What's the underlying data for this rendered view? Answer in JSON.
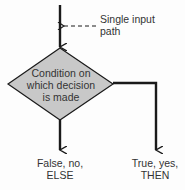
{
  "diagram": {
    "annotation": {
      "line1": "Single input",
      "line2": "path"
    },
    "decision": {
      "line1": "Condition on",
      "line2": "which decision",
      "line3": "is made"
    },
    "false_branch": {
      "line1": "False, no,",
      "line2": "ELSE"
    },
    "true_branch": {
      "line1": "True, yes,",
      "line2": "THEN"
    },
    "colors": {
      "diamond_fill": "#c8c8c8",
      "stroke": "#1a1a1a"
    }
  }
}
